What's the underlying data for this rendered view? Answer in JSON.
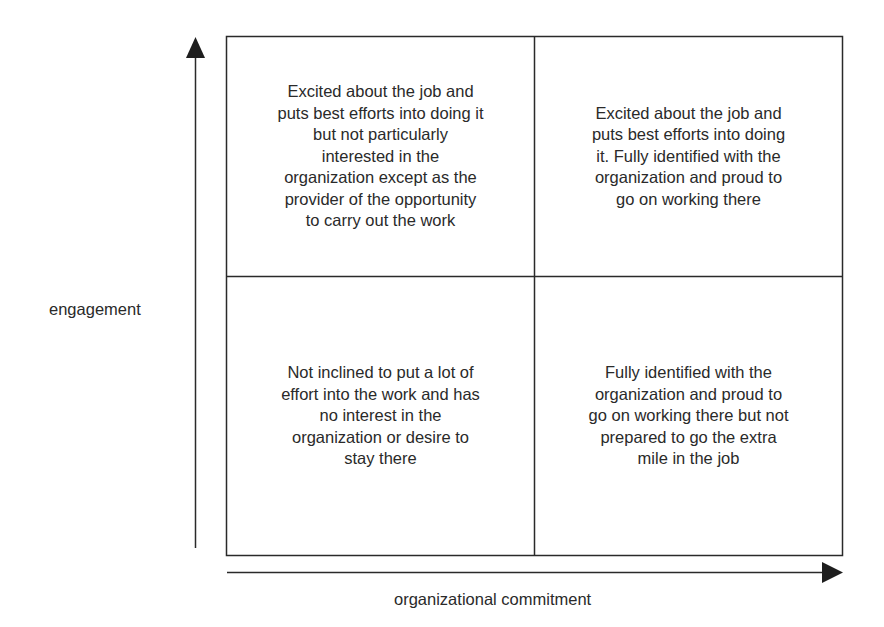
{
  "diagram": {
    "type": "2x2 matrix",
    "axes": {
      "y_label": "engagement",
      "x_label": "organizational commitment"
    },
    "quadrants": {
      "top_left": {
        "lines": [
          "Excited about the job and",
          "puts best efforts into doing it",
          "but not particularly",
          "interested in the",
          "organization except as the",
          "provider of the opportunity",
          "to carry out the work"
        ]
      },
      "top_right": {
        "lines": [
          "Excited about the job and",
          "puts best efforts into doing",
          "it. Fully identified with the",
          "organization and proud to",
          "go on working there"
        ]
      },
      "bottom_left": {
        "lines": [
          "Not inclined to put a lot of",
          "effort into the work and has",
          "no interest in the",
          "organization or desire to",
          "stay there"
        ]
      },
      "bottom_right": {
        "lines": [
          "Fully identified with the",
          "organization and proud to",
          "go on working there but not",
          "prepared to go the extra",
          "mile in the job"
        ]
      }
    },
    "colors": {
      "line": "#2a2a2a",
      "text": "#2a2a2a",
      "background": "#ffffff"
    }
  }
}
